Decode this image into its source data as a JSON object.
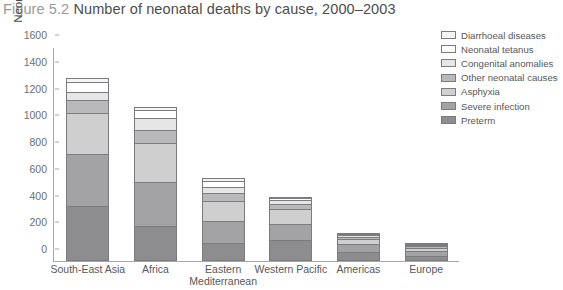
{
  "figure": {
    "number": "Figure 5.2",
    "title": "Number of neonatal deaths by cause, 2000–2003"
  },
  "chart_data": {
    "type": "bar",
    "stacked": true,
    "title": "Number of neonatal deaths by cause, 2000–2003",
    "xlabel": "",
    "ylabel": "Neonatal deaths (thousands)",
    "ylim": [
      0,
      1600
    ],
    "yticks": [
      0,
      200,
      400,
      600,
      800,
      1000,
      1200,
      1400,
      1600
    ],
    "grid": false,
    "legend_position": "right",
    "categories": [
      "South-East Asia",
      "Africa",
      "Eastern Mediterranean",
      "Western Pacific",
      "Americas",
      "Europe"
    ],
    "series": [
      {
        "name": "Preterm",
        "color": "#8d8d8f",
        "values": [
          410,
          265,
          135,
          155,
          70,
          40
        ]
      },
      {
        "name": "Severe infection",
        "color": "#a3a3a5",
        "values": [
          390,
          325,
          165,
          120,
          60,
          35
        ]
      },
      {
        "name": "Asphyxia",
        "color": "#cfcfd0",
        "values": [
          310,
          290,
          150,
          115,
          35,
          22
        ]
      },
      {
        "name": "Other neonatal causes",
        "color": "#b9b9bb",
        "values": [
          95,
          100,
          55,
          35,
          18,
          12
        ]
      },
      {
        "name": "Congenital anomalies",
        "color": "#e6e6e6",
        "values": [
          60,
          90,
          45,
          30,
          15,
          10
        ]
      },
      {
        "name": "Neonatal tetanus",
        "color": "#ffffff",
        "values": [
          70,
          60,
          50,
          15,
          7,
          3
        ]
      },
      {
        "name": "Diarrhoeal diseases",
        "color": "#f4f4f4",
        "values": [
          35,
          25,
          20,
          10,
          5,
          3
        ]
      }
    ],
    "totals": [
      1370,
      1155,
      620,
      480,
      210,
      125
    ]
  },
  "legend": {
    "items": [
      {
        "label": "Diarrhoeal diseases",
        "color": "#f4f4f4"
      },
      {
        "label": "Neonatal tetanus",
        "color": "#ffffff"
      },
      {
        "label": "Congenital anomalies",
        "color": "#e6e6e6"
      },
      {
        "label": "Other neonatal causes",
        "color": "#b9b9bb"
      },
      {
        "label": "Asphyxia",
        "color": "#cfcfd0"
      },
      {
        "label": "Severe infection",
        "color": "#a3a3a5"
      },
      {
        "label": "Preterm",
        "color": "#8d8d8f"
      }
    ]
  }
}
